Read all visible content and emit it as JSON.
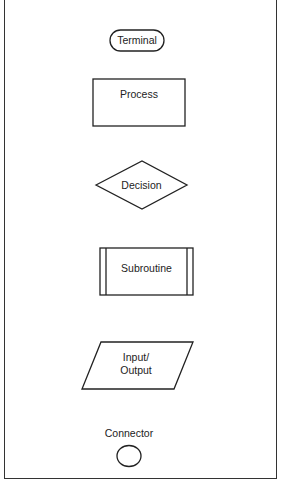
{
  "diagram": {
    "symbols": [
      {
        "id": "terminal",
        "shape": "rounded-pill",
        "label": "Terminal"
      },
      {
        "id": "process",
        "shape": "rectangle",
        "label": "Process"
      },
      {
        "id": "decision",
        "shape": "diamond",
        "label": "Decision"
      },
      {
        "id": "subroutine",
        "shape": "double-sided-rectangle",
        "label": "Subroutine"
      },
      {
        "id": "input-output",
        "shape": "parallelogram",
        "label_line1": "Input/",
        "label_line2": "Output"
      },
      {
        "id": "connector",
        "shape": "circle",
        "label": "Connector"
      }
    ],
    "stroke_color": "#222222",
    "background_color": "#ffffff"
  }
}
